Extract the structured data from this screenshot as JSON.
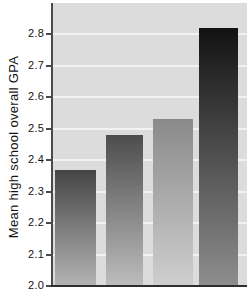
{
  "chart_data": {
    "type": "bar",
    "title": "",
    "xlabel": "",
    "ylabel": "Mean high school overall GPA",
    "categories": [
      "",
      "",
      "",
      ""
    ],
    "values": [
      2.37,
      2.48,
      2.53,
      2.82
    ],
    "ylim": [
      2.0,
      2.9
    ],
    "ytick_values": [
      2.0,
      2.1,
      2.2,
      2.3,
      2.4,
      2.5,
      2.6,
      2.7,
      2.8
    ],
    "ytick_labels": [
      "2.0",
      "2.1",
      "2.2",
      "2.3",
      "2.4",
      "2.5",
      "2.6",
      "2.7",
      "2.8"
    ],
    "legend": "none",
    "grid": "horizontal",
    "colors": {
      "plot_background": "#dcdcdc",
      "gridline": "#f2f2f2",
      "axis_line": "#4a4a4a",
      "baseline": "#2e2e2e",
      "tick_text": "#141414",
      "ylabel_text": "#141414",
      "bar_gradients": [
        {
          "top": "#454545",
          "bottom": "#b4b4b4"
        },
        {
          "top": "#4d4d4d",
          "bottom": "#bdbdbd"
        },
        {
          "top": "#8a8a8a",
          "bottom": "#cfcfcf"
        },
        {
          "top": "#121212",
          "bottom": "#8e8e8e"
        }
      ]
    }
  }
}
